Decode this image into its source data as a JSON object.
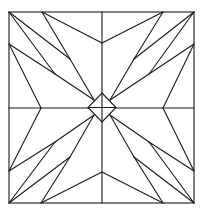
{
  "figure": {
    "title": "",
    "description": "Quilt block line drawing: square divided into quadrants with a central diamond and radiating star-like triangles",
    "stroke_color": "#1a1a1a",
    "background_color": "#ffffff"
  },
  "geometry": {
    "outer_square": {
      "x": 9,
      "y": 12,
      "width": 185,
      "height": 191
    },
    "center": {
      "x": 102,
      "y": 108
    },
    "diamond": {
      "top": [
        102,
        93
      ],
      "right": [
        116,
        107
      ],
      "bottom": [
        102,
        122
      ],
      "left": [
        88,
        107
      ]
    },
    "quadrant_top_left": {
      "corner": [
        9,
        12
      ],
      "top_edge_point": [
        42,
        12
      ],
      "left_edge_point": [
        9,
        44
      ],
      "vertical_midline_point": [
        102,
        43
      ],
      "horizontal_midline_point": [
        41,
        108
      ],
      "interior_p": [
        70,
        59
      ],
      "interior_q": [
        55,
        74
      ],
      "diamond_edge_point": [
        94,
        100
      ]
    }
  }
}
